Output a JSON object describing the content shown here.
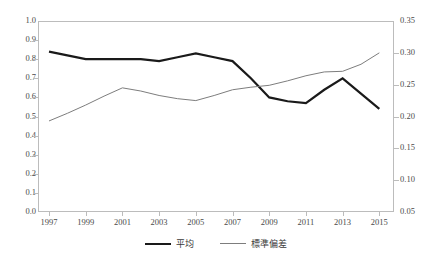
{
  "chart_data": {
    "type": "line",
    "title": "",
    "xlabel": "",
    "ylabel": "",
    "grid": false,
    "legend_position": "bottom-center",
    "x": [
      1997,
      1998,
      1999,
      2000,
      2001,
      2002,
      2003,
      2004,
      2005,
      2006,
      2007,
      2008,
      2009,
      2010,
      2011,
      2012,
      2013,
      2014,
      2015
    ],
    "xtick_labels": [
      "1997",
      "1999",
      "2001",
      "2003",
      "2005",
      "2007",
      "2009",
      "2011",
      "2013",
      "2015"
    ],
    "xtick_values": [
      1997,
      1999,
      2001,
      2003,
      2005,
      2007,
      2009,
      2011,
      2013,
      2015
    ],
    "xlim": [
      1996.4,
      2015.8
    ],
    "axes": [
      {
        "id": "left",
        "side": "left",
        "ylim": [
          0.0,
          1.0
        ],
        "ticks": [
          0.0,
          0.1,
          0.2,
          0.3,
          0.4,
          0.5,
          0.6,
          0.7,
          0.8,
          0.9,
          1.0
        ],
        "tick_labels": [
          "0.0",
          "0.1",
          "0.2",
          "0.3",
          "0.4",
          "0.5",
          "0.6",
          "0.7",
          "0.8",
          "0.9",
          "1.0"
        ]
      },
      {
        "id": "right",
        "side": "right",
        "ylim": [
          0.05,
          0.35
        ],
        "ticks": [
          0.05,
          0.1,
          0.15,
          0.2,
          0.25,
          0.3,
          0.35
        ],
        "tick_labels": [
          "0.05",
          "0.10",
          "0.15",
          "0.20",
          "0.25",
          "0.30",
          "0.35"
        ]
      }
    ],
    "series": [
      {
        "name": "平均",
        "axis": "left",
        "color": "#1a1a1a",
        "width": 2.2,
        "values": [
          0.84,
          0.82,
          0.8,
          0.8,
          0.8,
          0.8,
          0.79,
          0.81,
          0.83,
          0.81,
          0.79,
          0.7,
          0.6,
          0.58,
          0.57,
          0.64,
          0.7,
          0.62,
          0.54
        ]
      },
      {
        "name": "標準偏差",
        "axis": "right",
        "color": "#7d7d7d",
        "width": 1.0,
        "values": [
          0.193,
          0.205,
          0.218,
          0.232,
          0.245,
          0.24,
          0.233,
          0.228,
          0.225,
          0.233,
          0.242,
          0.246,
          0.249,
          0.256,
          0.264,
          0.27,
          0.271,
          0.282,
          0.3
        ]
      }
    ],
    "legend": [
      {
        "label": "平均",
        "style": "thick-black"
      },
      {
        "label": "標準偏差",
        "style": "thin-gray"
      }
    ]
  }
}
